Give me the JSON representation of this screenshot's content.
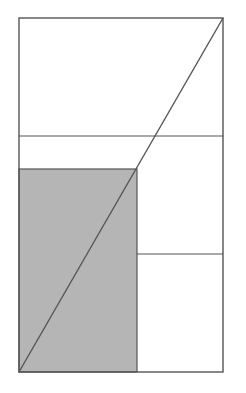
{
  "header": {
    "clipped_text_left": "",
    "clipped_text_right": ""
  },
  "diagram": {
    "outer_box": {
      "x1": 19,
      "y1": 18,
      "x2": 223,
      "y2": 372
    },
    "shaded_rect": {
      "x1": 19,
      "y1": 169,
      "x2": 137,
      "y2": 372,
      "fill": "#b5b5b5"
    },
    "horizontal_line_full": {
      "y": 136,
      "x1": 19,
      "x2": 223
    },
    "horizontal_line_partial": {
      "y": 254,
      "x1": 137,
      "x2": 223
    },
    "diagonal": {
      "x1": 19,
      "y1": 372,
      "x2": 223,
      "y2": 18
    },
    "stroke_color": "#555555",
    "background": "#ffffff"
  }
}
